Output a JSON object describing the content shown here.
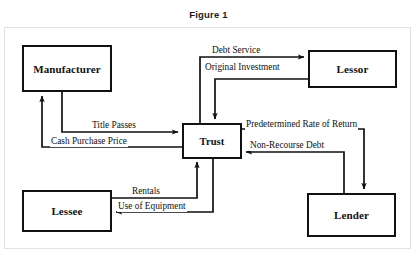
{
  "figure": {
    "title": "Figure 1",
    "type": "flow-diagram",
    "colors": {
      "line": "#111111",
      "box_border": "#111111",
      "background": "#ffffff",
      "frame": "#e2e2e2"
    }
  },
  "nodes": [
    {
      "id": "manufacturer",
      "label": "Manufacturer"
    },
    {
      "id": "lessor",
      "label": "Lessor"
    },
    {
      "id": "trust",
      "label": "Trust"
    },
    {
      "id": "lessee",
      "label": "Lessee"
    },
    {
      "id": "lender",
      "label": "Lender"
    }
  ],
  "edges": [
    {
      "id": "debt-service",
      "label": "Debt Service",
      "from": "trust",
      "to": "lessor"
    },
    {
      "id": "original-investment",
      "label": "Original Investment",
      "from": "lessor",
      "to": "trust"
    },
    {
      "id": "title-passes",
      "label": "Title Passes",
      "from": "manufacturer",
      "to": "trust"
    },
    {
      "id": "cash-purchase-price",
      "label": "Cash Purchase Price",
      "from": "trust",
      "to": "manufacturer"
    },
    {
      "id": "predetermined-rate-of-return",
      "label": "Predetermined Rate of Return",
      "from": "trust",
      "to": "lender"
    },
    {
      "id": "non-recourse-debt",
      "label": "Non-Recourse Debt",
      "from": "lender",
      "to": "trust"
    },
    {
      "id": "rentals",
      "label": "Rentals",
      "from": "lessee",
      "to": "trust"
    },
    {
      "id": "use-of-equipment",
      "label": "Use of Equipment",
      "from": "trust",
      "to": "lessee"
    }
  ]
}
